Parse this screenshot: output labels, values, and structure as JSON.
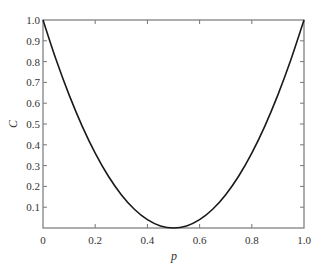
{
  "chart_data": {
    "type": "line",
    "title": "",
    "xlabel": "p",
    "ylabel": "C",
    "xlim": [
      0,
      1.0
    ],
    "ylim": [
      0,
      1.0
    ],
    "x_ticks": [
      "0",
      "0.2",
      "0.4",
      "0.6",
      "0.8",
      "1.0"
    ],
    "y_ticks": [
      "0.1",
      "0.2",
      "0.3",
      "0.4",
      "0.5",
      "0.6",
      "0.7",
      "0.8",
      "0.9",
      "1.0"
    ],
    "grid": false,
    "legend": null,
    "series": [
      {
        "name": "C",
        "x": [
          0,
          0.05,
          0.1,
          0.15,
          0.2,
          0.25,
          0.3,
          0.35,
          0.4,
          0.45,
          0.5,
          0.55,
          0.6,
          0.65,
          0.7,
          0.75,
          0.8,
          0.85,
          0.9,
          0.95,
          1.0
        ],
        "values": [
          1.0,
          0.81,
          0.64,
          0.49,
          0.36,
          0.25,
          0.16,
          0.09,
          0.04,
          0.01,
          0.0,
          0.01,
          0.04,
          0.09,
          0.16,
          0.25,
          0.36,
          0.49,
          0.64,
          0.81,
          1.0
        ],
        "color": "#1a1a1a"
      }
    ]
  },
  "style": {
    "frame_color": "#777777",
    "curve_color": "#1a1a1a"
  }
}
